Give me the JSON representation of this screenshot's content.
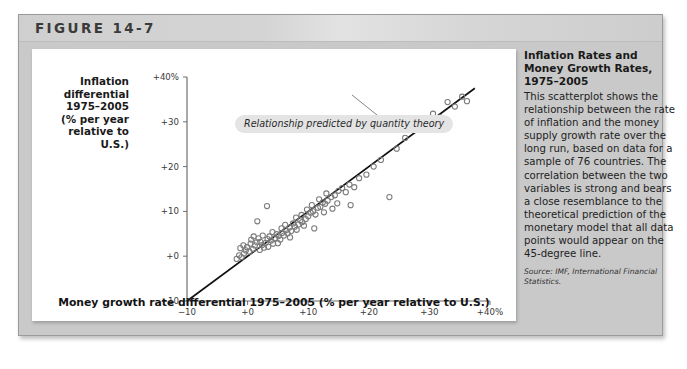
{
  "figure": {
    "label": "FIGURE 14-7"
  },
  "axes": {
    "y_title": "Inflation differential 1975–2005 (% per year relative to U.S.)",
    "y_title_lines": [
      "Inflation",
      "differential",
      "1975–2005",
      "(% per year",
      "relative to",
      "U.S.)"
    ],
    "x_title": "Money growth rate differential 1975–2005 (% per year relative to U.S.)"
  },
  "callout": {
    "text": "Relationship predicted by quantity theory"
  },
  "caption": {
    "title": "Inflation Rates and Money Growth Rates, 1975–2005",
    "body": "This scatterplot shows the relationship between the rate of inflation and the money supply growth rate over the long run, based on data for a sample of 76 countries. The correlation between the two variables is strong and bears a close resemblance to the theoretical prediction of the monetary model that all data points would appear on the 45-degree line.",
    "source": "Source: IMF, International Financial Statistics."
  },
  "colors": {
    "card_background": "#c9c9c9",
    "header_band": "#d6d6d6",
    "panel_background": "#ffffff",
    "axis_line": "#6f6f6f",
    "data_point_stroke": "#7b7b7b",
    "trend_line": "#111111",
    "callout_background": "#e4e4e4",
    "text": "#1a1a1a"
  },
  "chart_data": {
    "type": "scatter",
    "title": "Inflation Rates and Money Growth Rates, 1975–2005",
    "xlabel": "Money growth rate differential 1975–2005 (% per year relative to U.S.)",
    "ylabel": "Inflation differential 1975–2005 (% per year relative to U.S.)",
    "xlim": [
      -10,
      40
    ],
    "ylim": [
      -10,
      40
    ],
    "xticks": [
      -10,
      0,
      10,
      20,
      30,
      40
    ],
    "xticklabels": [
      "−10",
      "+0",
      "+10",
      "+20",
      "+30",
      "+40%"
    ],
    "yticks": [
      -10,
      0,
      10,
      20,
      30,
      40
    ],
    "yticklabels": [
      "−10",
      "+0",
      "+10",
      "+20",
      "+30",
      "+40%"
    ],
    "grid": false,
    "legend": null,
    "n_countries": 76,
    "reference_line": {
      "label": "Relationship predicted by quantity theory",
      "description": "45-degree line",
      "slope": 1,
      "intercept": 0,
      "from": [
        -10,
        -10
      ],
      "to": [
        37.5,
        37.5
      ]
    },
    "points": [
      [
        -1.8,
        -0.6
      ],
      [
        -1.4,
        0.2
      ],
      [
        -1.0,
        -0.2
      ],
      [
        -0.6,
        0.6
      ],
      [
        -0.3,
        1.3
      ],
      [
        -1.2,
        1.8
      ],
      [
        -0.7,
        2.4
      ],
      [
        -0.1,
        2.0
      ],
      [
        0.3,
        1.0
      ],
      [
        0.5,
        2.8
      ],
      [
        0.9,
        1.6
      ],
      [
        1.2,
        2.4
      ],
      [
        1.5,
        3.1
      ],
      [
        0.6,
        3.7
      ],
      [
        1.0,
        4.4
      ],
      [
        1.8,
        4.0
      ],
      [
        2.1,
        3.2
      ],
      [
        2.4,
        2.5
      ],
      [
        2.0,
        1.4
      ],
      [
        2.7,
        1.9
      ],
      [
        3.0,
        3.0
      ],
      [
        3.3,
        3.8
      ],
      [
        2.5,
        4.6
      ],
      [
        3.6,
        4.4
      ],
      [
        3.9,
        3.5
      ],
      [
        4.2,
        2.8
      ],
      [
        3.4,
        2.1
      ],
      [
        4.5,
        4.0
      ],
      [
        4.8,
        4.9
      ],
      [
        4.1,
        5.4
      ],
      [
        5.1,
        4.5
      ],
      [
        5.4,
        3.7
      ],
      [
        5.0,
        2.9
      ],
      [
        5.7,
        5.2
      ],
      [
        6.0,
        4.6
      ],
      [
        6.3,
        5.8
      ],
      [
        5.6,
        6.2
      ],
      [
        6.6,
        5.1
      ],
      [
        6.9,
        6.4
      ],
      [
        7.2,
        5.6
      ],
      [
        6.2,
        7.0
      ],
      [
        7.5,
        7.3
      ],
      [
        7.8,
        6.6
      ],
      [
        8.1,
        5.9
      ],
      [
        7.0,
        4.2
      ],
      [
        8.4,
        7.1
      ],
      [
        8.7,
        8.0
      ],
      [
        8.0,
        8.6
      ],
      [
        9.0,
        7.6
      ],
      [
        9.3,
        6.8
      ],
      [
        9.6,
        8.3
      ],
      [
        8.9,
        9.2
      ],
      [
        10.0,
        8.9
      ],
      [
        10.4,
        9.7
      ],
      [
        9.8,
        10.4
      ],
      [
        10.8,
        10.0
      ],
      [
        11.2,
        9.3
      ],
      [
        11.6,
        10.8
      ],
      [
        10.6,
        11.4
      ],
      [
        12.0,
        11.0
      ],
      [
        12.4,
        12.0
      ],
      [
        11.8,
        12.7
      ],
      [
        12.8,
        11.7
      ],
      [
        13.2,
        12.4
      ],
      [
        13.8,
        13.2
      ],
      [
        13.0,
        14.0
      ],
      [
        14.4,
        13.6
      ],
      [
        12.6,
        9.8
      ],
      [
        14.0,
        10.6
      ],
      [
        15.0,
        14.6
      ],
      [
        15.6,
        15.2
      ],
      [
        16.2,
        14.3
      ],
      [
        14.8,
        11.8
      ],
      [
        16.8,
        16.0
      ],
      [
        17.6,
        15.4
      ],
      [
        18.4,
        17.4
      ],
      [
        19.6,
        18.2
      ],
      [
        20.8,
        20.0
      ],
      [
        22.0,
        21.5
      ],
      [
        23.4,
        13.2
      ],
      [
        24.6,
        24.0
      ],
      [
        26.0,
        26.4
      ],
      [
        27.4,
        28.6
      ],
      [
        29.0,
        28.2
      ],
      [
        30.6,
        31.8
      ],
      [
        31.8,
        31.0
      ],
      [
        33.0,
        34.4
      ],
      [
        34.2,
        33.4
      ],
      [
        35.4,
        35.6
      ],
      [
        36.2,
        34.6
      ],
      [
        3.2,
        11.2
      ],
      [
        1.6,
        7.8
      ],
      [
        11.0,
        6.2
      ],
      [
        17.0,
        11.4
      ]
    ]
  }
}
